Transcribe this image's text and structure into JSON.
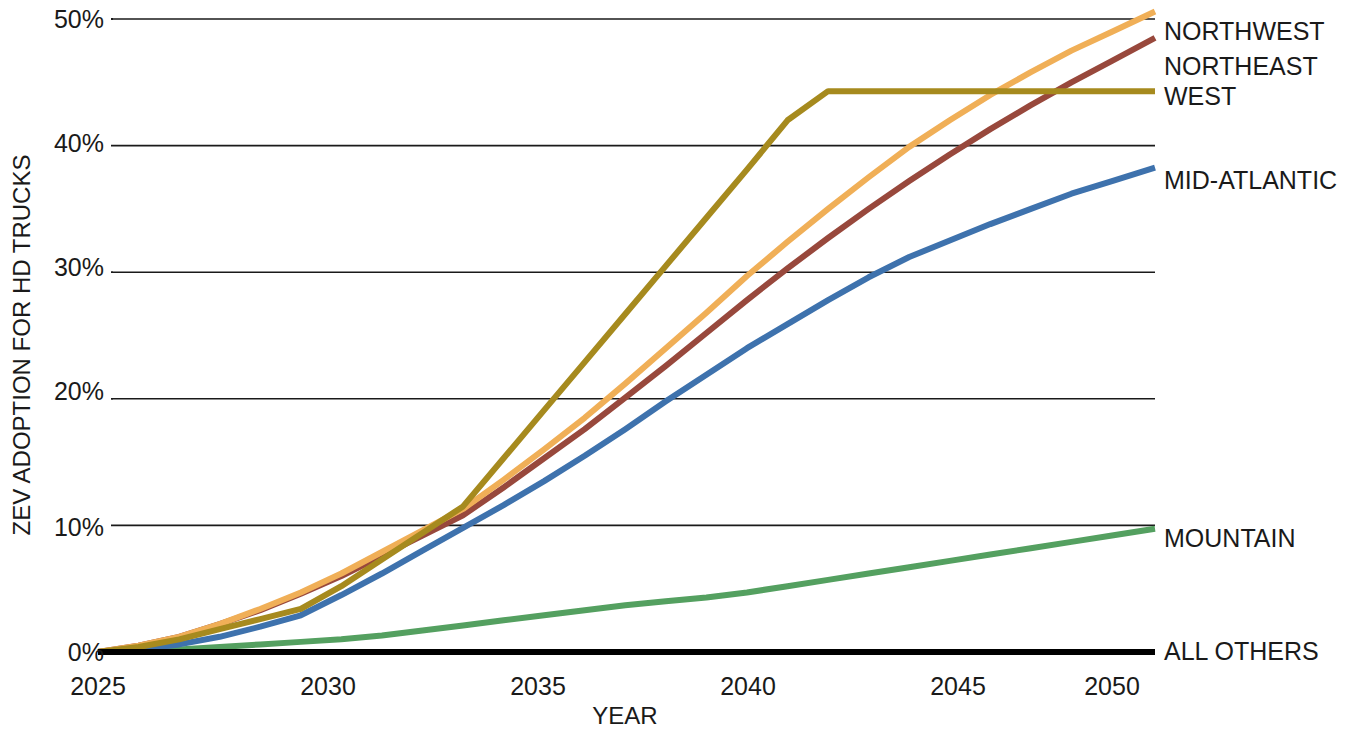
{
  "chart_data": {
    "type": "line",
    "title": "",
    "xlabel": "YEAR",
    "ylabel": "ZEV ADOPTION FOR HD TRUCKS",
    "xlim": [
      2025,
      2050
    ],
    "ylim": [
      0,
      50
    ],
    "xticks": [
      2025,
      2030,
      2035,
      2040,
      2045,
      2050
    ],
    "xtick_labels": [
      "2025",
      "2030",
      "2035",
      "2040",
      "2045",
      "2050"
    ],
    "yticks": [
      0,
      10,
      20,
      30,
      40,
      50
    ],
    "ytick_labels": [
      "0%",
      "10%",
      "20%",
      "30%",
      "40%",
      "50%"
    ],
    "grid": "horizontal",
    "legend_position": "right-inline-end-of-line",
    "x": [
      2025,
      2026,
      2027,
      2028,
      2029,
      2030,
      2031,
      2032,
      2033,
      2034,
      2035,
      2036,
      2037,
      2038,
      2039,
      2040,
      2041,
      2042,
      2043,
      2044,
      2045,
      2046,
      2047,
      2048,
      2049,
      2050
    ],
    "series": [
      {
        "name": "NORTHWEST",
        "color": "#F0AF57",
        "values": [
          0.0,
          0.5,
          1.2,
          2.2,
          3.4,
          4.7,
          6.2,
          7.9,
          9.6,
          11.3,
          13.6,
          16.0,
          18.5,
          21.2,
          24.0,
          26.8,
          29.7,
          32.4,
          35.0,
          37.5,
          39.9,
          42.0,
          44.0,
          45.8,
          47.5,
          49.0
        ]
      },
      {
        "name": "NORTHEAST",
        "color": "#98483C",
        "values": [
          0.0,
          0.5,
          1.2,
          2.2,
          3.3,
          4.6,
          6.0,
          7.6,
          9.2,
          10.8,
          13.0,
          15.3,
          17.6,
          20.1,
          22.6,
          25.2,
          27.8,
          30.3,
          32.7,
          35.0,
          37.2,
          39.3,
          41.3,
          43.2,
          45.0,
          46.7
        ]
      },
      {
        "name": "WEST",
        "color": "#A68A1E",
        "values": [
          0.0,
          0.4,
          1.0,
          1.8,
          2.6,
          3.4,
          5.2,
          7.3,
          9.4,
          11.5,
          15.3,
          19.1,
          22.9,
          26.7,
          30.5,
          34.3,
          38.1,
          42.0,
          44.3,
          44.3,
          44.3,
          44.3,
          44.3,
          44.3,
          44.3,
          44.3
        ]
      },
      {
        "name": "MID-ATLANTIC",
        "color": "#3E72AD",
        "values": [
          0.0,
          0.2,
          0.6,
          1.2,
          2.0,
          2.9,
          4.5,
          6.2,
          8.0,
          9.8,
          11.6,
          13.5,
          15.5,
          17.6,
          19.8,
          21.9,
          24.0,
          25.9,
          27.8,
          29.6,
          31.2,
          32.5,
          33.8,
          35.0,
          36.2,
          37.2
        ]
      },
      {
        "name": "MOUNTAIN",
        "color": "#54A060",
        "values": [
          0.0,
          0.1,
          0.2,
          0.4,
          0.6,
          0.8,
          1.0,
          1.3,
          1.7,
          2.1,
          2.5,
          2.9,
          3.3,
          3.7,
          4.0,
          4.3,
          4.7,
          5.2,
          5.7,
          6.2,
          6.7,
          7.2,
          7.7,
          8.2,
          8.7,
          9.2
        ]
      },
      {
        "name": "ALL OTHERS",
        "color": "#000000",
        "values": [
          0.0,
          0.0,
          0.0,
          0.0,
          0.0,
          0.0,
          0.0,
          0.0,
          0.0,
          0.0,
          0.0,
          0.0,
          0.0,
          0.0,
          0.0,
          0.0,
          0.0,
          0.0,
          0.0,
          0.0,
          0.0,
          0.0,
          0.0,
          0.0,
          0.0,
          0.0
        ]
      }
    ],
    "legend_labels": [
      {
        "text": "NORTHWEST",
        "y_value": 49.0
      },
      {
        "text": "NORTHEAST",
        "y_value": 46.7
      },
      {
        "text": "WEST",
        "y_value": 44.3
      },
      {
        "text": "MID-ATLANTIC",
        "y_value": 37.2
      },
      {
        "text": "MOUNTAIN",
        "y_value": 9.2
      },
      {
        "text": "ALL OTHERS",
        "y_value": 0.0
      }
    ]
  },
  "axes": {
    "y_title": "ZEV ADOPTION FOR HD TRUCKS",
    "x_title": "YEAR",
    "y_tick_0": "0%",
    "y_tick_1": "10%",
    "y_tick_2": "20%",
    "y_tick_3": "30%",
    "y_tick_4": "40%",
    "y_tick_5": "50%",
    "x_tick_0": "2025",
    "x_tick_1": "2030",
    "x_tick_2": "2035",
    "x_tick_3": "2040",
    "x_tick_4": "2045",
    "x_tick_5": "2050"
  },
  "legend": {
    "l0": "NORTHWEST",
    "l1": "NORTHEAST",
    "l2": "WEST",
    "l3": "MID-ATLANTIC",
    "l4": "MOUNTAIN",
    "l5": "ALL OTHERS"
  }
}
